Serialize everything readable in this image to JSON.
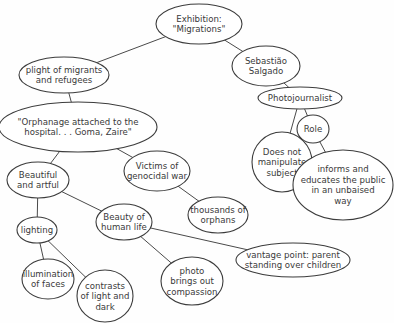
{
  "diagram": {
    "type": "concept-map",
    "nodes": [
      {
        "id": "exhibition",
        "lines": [
          "Exhibition:",
          "\"Migrations\""
        ],
        "cx": 199,
        "cy": 24,
        "rx": 43,
        "ry": 20
      },
      {
        "id": "plight",
        "lines": [
          "plight of migrants",
          "and refugees"
        ],
        "cx": 64,
        "cy": 75,
        "rx": 45,
        "ry": 18
      },
      {
        "id": "salgado",
        "lines": [
          "Sebastião",
          "Salgado"
        ],
        "cx": 266,
        "cy": 66,
        "rx": 34,
        "ry": 20
      },
      {
        "id": "photojournalist",
        "lines": [
          "Photojournalist"
        ],
        "cx": 300,
        "cy": 98,
        "rx": 42,
        "ry": 11
      },
      {
        "id": "orphanage",
        "lines": [
          "\"Orphanage attached to the",
          "hospital. . . Goma, Zaire\""
        ],
        "cx": 78,
        "cy": 127,
        "rx": 79,
        "ry": 25
      },
      {
        "id": "role",
        "lines": [
          "Role"
        ],
        "cx": 313,
        "cy": 129,
        "rx": 16,
        "ry": 14
      },
      {
        "id": "manipulate",
        "lines": [
          "Does not",
          "manipulate",
          "subject"
        ],
        "cx": 282,
        "cy": 162,
        "rx": 30,
        "ry": 30
      },
      {
        "id": "victims",
        "lines": [
          "Victims of",
          "genocidal war"
        ],
        "cx": 157,
        "cy": 171,
        "rx": 33,
        "ry": 20
      },
      {
        "id": "beautiful",
        "lines": [
          "Beautiful",
          "and artful"
        ],
        "cx": 38,
        "cy": 180,
        "rx": 31,
        "ry": 18
      },
      {
        "id": "informs",
        "lines": [
          "informs and",
          "educates the public",
          "in an unbaised",
          "way"
        ],
        "cx": 343,
        "cy": 185,
        "rx": 50,
        "ry": 35
      },
      {
        "id": "thousands",
        "lines": [
          "thousands of",
          "orphans"
        ],
        "cx": 218,
        "cy": 215,
        "rx": 30,
        "ry": 18
      },
      {
        "id": "beauty_life",
        "lines": [
          "Beauty of",
          "human life"
        ],
        "cx": 124,
        "cy": 222,
        "rx": 28,
        "ry": 18
      },
      {
        "id": "lighting",
        "lines": [
          "lighting"
        ],
        "cx": 37,
        "cy": 230,
        "rx": 20,
        "ry": 13
      },
      {
        "id": "vantage",
        "lines": [
          "vantage point: parent",
          "standing over children"
        ],
        "cx": 293,
        "cy": 260,
        "rx": 57,
        "ry": 17
      },
      {
        "id": "illumination",
        "lines": [
          "illumination",
          "of faces"
        ],
        "cx": 48,
        "cy": 279,
        "rx": 26,
        "ry": 20
      },
      {
        "id": "compassion",
        "lines": [
          "photo",
          "brings out",
          "compassion"
        ],
        "cx": 192,
        "cy": 281,
        "rx": 31,
        "ry": 24
      },
      {
        "id": "contrasts",
        "lines": [
          "contrasts",
          "of light and",
          "dark"
        ],
        "cx": 105,
        "cy": 296,
        "rx": 28,
        "ry": 26
      }
    ],
    "edges": [
      [
        "exhibition",
        "plight"
      ],
      [
        "exhibition",
        "salgado"
      ],
      [
        "salgado",
        "photojournalist"
      ],
      [
        "photojournalist",
        "manipulate"
      ],
      [
        "photojournalist",
        "role"
      ],
      [
        "role",
        "informs"
      ],
      [
        "plight",
        "orphanage"
      ],
      [
        "orphanage",
        "beautiful"
      ],
      [
        "orphanage",
        "victims"
      ],
      [
        "victims",
        "thousands"
      ],
      [
        "beautiful",
        "beauty_life"
      ],
      [
        "beautiful",
        "lighting"
      ],
      [
        "lighting",
        "illumination"
      ],
      [
        "lighting",
        "contrasts"
      ],
      [
        "beauty_life",
        "compassion"
      ],
      [
        "beauty_life",
        "vantage"
      ]
    ]
  },
  "labels": {
    "exhibition": "Exhibition: \"Migrations\"",
    "plight": "plight of migrants and refugees",
    "salgado": "Sebastião Salgado",
    "photojournalist": "Photojournalist",
    "orphanage": "\"Orphanage attached to the hospital. . . Goma, Zaire\"",
    "role": "Role",
    "manipulate": "Does not manipulate subject",
    "victims": "Victims of genocidal war",
    "beautiful": "Beautiful and artful",
    "informs": "informs and educates the public in an unbaised way",
    "thousands": "thousands of orphans",
    "beauty_life": "Beauty of human life",
    "lighting": "lighting",
    "vantage": "vantage point: parent standing over children",
    "illumination": "illumination of faces",
    "compassion": "photo brings out compassion",
    "contrasts": "contrasts of light and dark"
  },
  "colors": {
    "background": "#fefefe",
    "stroke": "#3c3c3c",
    "text": "#3a3a3a"
  }
}
